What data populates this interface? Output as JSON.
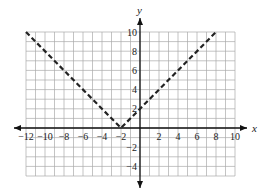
{
  "chart_data": {
    "type": "line",
    "title": "",
    "xlabel": "x",
    "ylabel": "y",
    "xlim": [
      -12,
      10
    ],
    "ylim": [
      -5,
      10
    ],
    "grid": true,
    "grid_step": 1,
    "x_ticks": [
      -12,
      -10,
      -8,
      -6,
      -4,
      -2,
      2,
      4,
      6,
      8,
      10
    ],
    "x_tick_labels": [
      "−12",
      "−10",
      "−8",
      "−6",
      "−4",
      "−2",
      "2",
      "4",
      "6",
      "8",
      "10"
    ],
    "y_ticks": [
      10,
      8,
      6,
      4,
      2,
      -2,
      -4
    ],
    "y_tick_labels": [
      "10",
      "8",
      "6",
      "4",
      "2",
      "−2",
      "−4"
    ],
    "series": [
      {
        "name": "y = |x + 2|",
        "style": "dashed",
        "color": "#222222",
        "points": [
          [
            -12,
            10
          ],
          [
            -2,
            0
          ],
          [
            8,
            10
          ]
        ]
      }
    ],
    "legend": null
  },
  "colors": {
    "grid": "#aaaaaa",
    "axis": "#111111",
    "curve": "#222222",
    "background": "#ffffff"
  }
}
